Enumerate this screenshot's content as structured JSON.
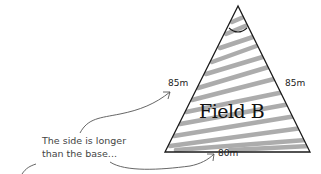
{
  "diagram": {
    "shape": "isosceles-triangle",
    "title": "Field B",
    "sides": {
      "left": "85m",
      "right": "85m",
      "base": "80m"
    },
    "annotation": {
      "line1": "The side is longer",
      "line2": "than the base..."
    },
    "colors": {
      "outline": "#1a1a1a",
      "hatch": "#a8a8a8",
      "text": "#222222",
      "background": "#ffffff"
    }
  }
}
